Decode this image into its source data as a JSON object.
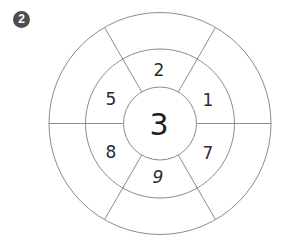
{
  "badge": {
    "label": "2",
    "color": "#4d4d4d"
  },
  "wheel": {
    "center_value": "3",
    "inner_ring": [
      {
        "position": "top",
        "value": "2"
      },
      {
        "position": "top-right",
        "value": "1"
      },
      {
        "position": "bottom-right",
        "value": "7"
      },
      {
        "position": "bottom",
        "value": "9"
      },
      {
        "position": "bottom-left",
        "value": "8"
      },
      {
        "position": "top-left",
        "value": "5"
      }
    ],
    "outer_ring": [
      {
        "position": "top",
        "value": ""
      },
      {
        "position": "top-right",
        "value": ""
      },
      {
        "position": "bottom-right",
        "value": ""
      },
      {
        "position": "bottom",
        "value": ""
      },
      {
        "position": "bottom-left",
        "value": ""
      },
      {
        "position": "top-left",
        "value": ""
      }
    ],
    "line_color": "#8c8c8c"
  }
}
